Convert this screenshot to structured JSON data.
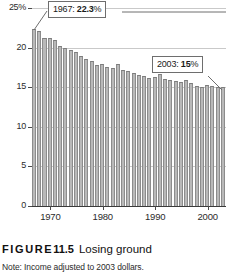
{
  "chart_data": {
    "type": "bar",
    "title": "Losing ground",
    "xlabel": "",
    "ylabel": "",
    "ylim": [
      0,
      25
    ],
    "xlim": [
      1967,
      2003
    ],
    "grid": true,
    "legend": false,
    "y_ticks": [
      {
        "value": 25,
        "label": "25%"
      },
      {
        "value": 20,
        "label": "20"
      },
      {
        "value": 15,
        "label": "15"
      },
      {
        "value": 10,
        "label": "10"
      },
      {
        "value": 5,
        "label": "5"
      },
      {
        "value": 0,
        "label": "0"
      }
    ],
    "x_ticks": [
      {
        "value": 1970,
        "label": "1970"
      },
      {
        "value": 1980,
        "label": "1980"
      },
      {
        "value": 1990,
        "label": "1990"
      },
      {
        "value": 2000,
        "label": "2000"
      }
    ],
    "categories": [
      1967,
      1968,
      1969,
      1970,
      1971,
      1972,
      1973,
      1974,
      1975,
      1976,
      1977,
      1978,
      1979,
      1980,
      1981,
      1982,
      1983,
      1984,
      1985,
      1986,
      1987,
      1988,
      1989,
      1990,
      1991,
      1992,
      1993,
      1994,
      1995,
      1996,
      1997,
      1998,
      1999,
      2000,
      2001,
      2002,
      2003
    ],
    "values": [
      22.3,
      22.1,
      21.2,
      21.2,
      21.0,
      20.2,
      20.0,
      19.7,
      19.4,
      19.0,
      18.6,
      18.3,
      17.8,
      17.9,
      17.6,
      17.4,
      17.9,
      17.2,
      17.1,
      16.8,
      16.6,
      16.4,
      16.2,
      16.3,
      16.7,
      16.1,
      15.9,
      15.8,
      15.6,
      15.9,
      15.5,
      15.1,
      15.0,
      15.3,
      15.2,
      15.0,
      15.0
    ],
    "annotations": [
      {
        "name": "first-year-callout",
        "year": 1967,
        "value_text": "22.3",
        "prefix": "1967: ",
        "suffix": "%"
      },
      {
        "name": "last-year-callout",
        "year": 2003,
        "value_text": "15",
        "prefix": "2003: ",
        "suffix": "%"
      }
    ],
    "colors": {
      "bar_fill": "#b9b9b9",
      "bar_stroke": "#8c8c8c",
      "grid": "#c9c9c9",
      "axis": "#3a3a3a",
      "text": "#1a1a1a",
      "background": "#ffffff"
    }
  },
  "caption": {
    "figure_word": "FIGURE",
    "figure_number": "11.5",
    "title": "Losing ground"
  },
  "note": {
    "text": "Note: Income adjusted to 2003 dollars."
  }
}
